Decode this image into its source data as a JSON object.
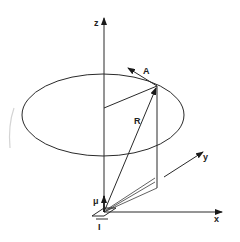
{
  "figure": {
    "colors": {
      "line": "#2a2a2a",
      "background": "#ffffff"
    }
  },
  "axes": {
    "z": {
      "label": "z"
    },
    "x": {
      "label": "x"
    },
    "y": {
      "label": "y"
    }
  },
  "vectors": {
    "A": {
      "label": "A"
    },
    "R": {
      "label": "R"
    },
    "mu": {
      "label": "μ"
    }
  },
  "current": {
    "label": "I"
  }
}
